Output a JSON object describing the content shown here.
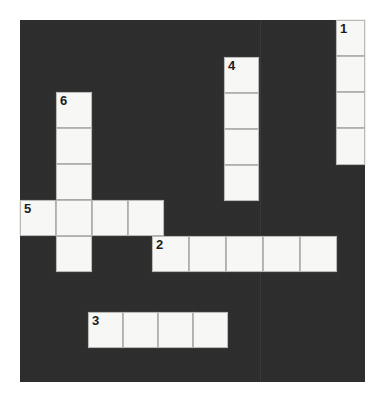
{
  "puzzle": {
    "title": "Crossword Grid",
    "grid": {
      "origin_x": 20,
      "origin_y": 20,
      "width": 345,
      "height": 362,
      "cell_size": 34,
      "background_color": "#2b2b2b",
      "cell_color": "#f7f7f5",
      "cell_border_color": "#b9b9b6",
      "number_color": "#1d1d1d",
      "seam_x": 260
    },
    "entries": [
      {
        "number": "1",
        "direction": "down",
        "length": 4,
        "start": {
          "x": 336,
          "y": 20
        },
        "cells": [
          {
            "x": 336,
            "y": 20,
            "w": 29,
            "h": 36,
            "number": "1"
          },
          {
            "x": 336,
            "y": 56,
            "w": 29,
            "h": 36,
            "number": ""
          },
          {
            "x": 336,
            "y": 92,
            "w": 29,
            "h": 36,
            "number": ""
          },
          {
            "x": 336,
            "y": 128,
            "w": 29,
            "h": 37,
            "number": ""
          }
        ]
      },
      {
        "number": "4",
        "direction": "down",
        "length": 4,
        "start": {
          "x": 224,
          "y": 57
        },
        "cells": [
          {
            "x": 224,
            "y": 57,
            "w": 35,
            "h": 36,
            "number": "4"
          },
          {
            "x": 224,
            "y": 93,
            "w": 35,
            "h": 36,
            "number": ""
          },
          {
            "x": 224,
            "y": 129,
            "w": 35,
            "h": 36,
            "number": ""
          },
          {
            "x": 224,
            "y": 165,
            "w": 35,
            "h": 36,
            "number": ""
          }
        ]
      },
      {
        "number": "6",
        "direction": "down",
        "length": 5,
        "start": {
          "x": 56,
          "y": 92
        },
        "cells": [
          {
            "x": 56,
            "y": 92,
            "w": 36,
            "h": 36,
            "number": "6"
          },
          {
            "x": 56,
            "y": 128,
            "w": 36,
            "h": 36,
            "number": ""
          },
          {
            "x": 56,
            "y": 164,
            "w": 36,
            "h": 36,
            "number": ""
          },
          {
            "x": 56,
            "y": 200,
            "w": 36,
            "h": 36,
            "number": ""
          },
          {
            "x": 56,
            "y": 236,
            "w": 36,
            "h": 36,
            "number": ""
          }
        ]
      },
      {
        "number": "5",
        "direction": "across",
        "length": 4,
        "start": {
          "x": 20,
          "y": 200
        },
        "cells": [
          {
            "x": 20,
            "y": 200,
            "w": 36,
            "h": 36,
            "number": "5"
          },
          {
            "x": 56,
            "y": 200,
            "w": 36,
            "h": 36,
            "number": ""
          },
          {
            "x": 92,
            "y": 200,
            "w": 36,
            "h": 36,
            "number": ""
          },
          {
            "x": 128,
            "y": 200,
            "w": 36,
            "h": 36,
            "number": ""
          }
        ]
      },
      {
        "number": "2",
        "direction": "across",
        "length": 5,
        "start": {
          "x": 152,
          "y": 236
        },
        "cells": [
          {
            "x": 152,
            "y": 236,
            "w": 37,
            "h": 36,
            "number": "2"
          },
          {
            "x": 189,
            "y": 236,
            "w": 37,
            "h": 36,
            "number": ""
          },
          {
            "x": 226,
            "y": 236,
            "w": 37,
            "h": 36,
            "number": ""
          },
          {
            "x": 263,
            "y": 236,
            "w": 37,
            "h": 36,
            "number": ""
          },
          {
            "x": 300,
            "y": 236,
            "w": 37,
            "h": 36,
            "number": ""
          }
        ]
      },
      {
        "number": "3",
        "direction": "across",
        "length": 4,
        "start": {
          "x": 88,
          "y": 312
        },
        "cells": [
          {
            "x": 88,
            "y": 312,
            "w": 35,
            "h": 36,
            "number": "3"
          },
          {
            "x": 123,
            "y": 312,
            "w": 35,
            "h": 36,
            "number": ""
          },
          {
            "x": 158,
            "y": 312,
            "w": 35,
            "h": 36,
            "number": ""
          },
          {
            "x": 193,
            "y": 312,
            "w": 35,
            "h": 36,
            "number": ""
          }
        ]
      }
    ]
  }
}
